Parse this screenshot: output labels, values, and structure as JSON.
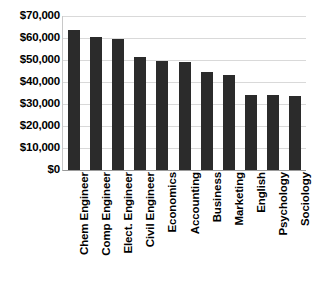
{
  "chart_data": {
    "type": "bar",
    "title": "",
    "xlabel": "",
    "ylabel": "",
    "ylim": [
      0,
      70000
    ],
    "ytick_values": [
      0,
      10000,
      20000,
      30000,
      40000,
      50000,
      60000,
      70000
    ],
    "ytick_labels": [
      "$0",
      "$10,000",
      "$20,000",
      "$30,000",
      "$40,000",
      "$50,000",
      "$60,000",
      "$70,000"
    ],
    "grid": true,
    "legend": false,
    "bar_color": "#2b2b2b",
    "gridline_color": "#d9d9d9",
    "axis_color": "#9a9a9a",
    "categories": [
      "Chem Engineer",
      "Comp Engineer",
      "Elect. Engineer",
      "Civil Engineer",
      "Economics",
      "Accounting",
      "Business",
      "Marketing",
      "English",
      "Psychology",
      "Sociology"
    ],
    "values": [
      63500,
      60500,
      59500,
      51500,
      49500,
      49000,
      44500,
      43000,
      34000,
      34000,
      33500
    ]
  }
}
